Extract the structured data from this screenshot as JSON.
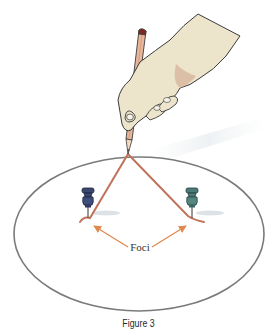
{
  "figure": {
    "caption": "Figure 3",
    "foci_label": "Foci",
    "ellipse": {
      "cx": 139,
      "cy": 234,
      "rx": 125,
      "ry": 77,
      "stroke": "#7a7a7a"
    },
    "foci": [
      {
        "name": "left-pushpin",
        "x": 88,
        "y": 212,
        "color": "#3a4870"
      },
      {
        "name": "right-pushpin",
        "x": 192,
        "y": 212,
        "color": "#4b7a78"
      }
    ],
    "pencil_tip": {
      "x": 128,
      "y": 154
    },
    "colors": {
      "string": "#c0735a",
      "arrow": "#e0894f",
      "skin": "#ece5cc",
      "skin_shadow": "#d9b9a0",
      "pencil": "#e8b69a",
      "eraser": "#7a2a22",
      "outline": "#3b3b3b"
    }
  }
}
